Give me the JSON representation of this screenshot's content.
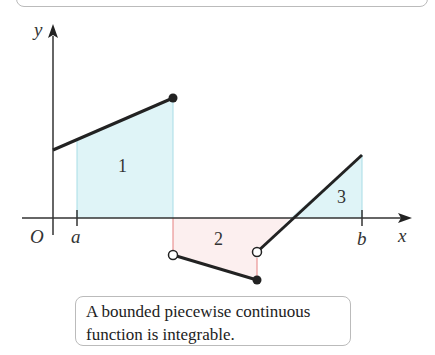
{
  "figure": {
    "labels": {
      "y_axis": "y",
      "x_axis": "x",
      "origin": "O",
      "a": "a",
      "b": "b"
    },
    "regions": [
      {
        "id": "1",
        "label": "1",
        "sign": "positive",
        "fill": "#dff4f7"
      },
      {
        "id": "2",
        "label": "2",
        "sign": "negative",
        "fill": "#fcefef"
      },
      {
        "id": "3",
        "label": "3",
        "sign": "positive",
        "fill": "#dff4f7"
      }
    ],
    "colors": {
      "curve": "#222222",
      "positive_fill": "#dff4f7",
      "negative_fill": "#fcefef",
      "guide_pos": "#a8dde6",
      "guide_neg": "#e58080"
    }
  },
  "caption": {
    "text": "A bounded piecewise continuous function is integrable."
  }
}
